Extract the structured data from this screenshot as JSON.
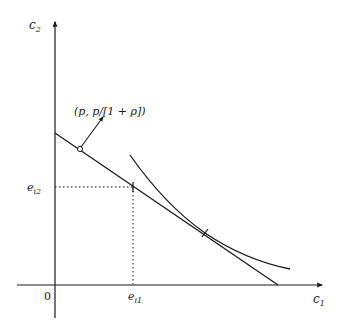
{
  "diagram": {
    "type": "intertemporal-consumption-choice",
    "axes": {
      "x": {
        "label": "c",
        "subscript": "1"
      },
      "y": {
        "label": "c",
        "subscript": "2"
      },
      "origin_label": "0"
    },
    "endowment": {
      "x_label": "e",
      "x_subscript": "i1",
      "y_label": "e",
      "y_subscript": "i2"
    },
    "budget_line_normal_label": "(p, p/[1 + ρ])",
    "elements": [
      "budget line through endowment point",
      "indifference curve tangent to budget line",
      "normal vector to budget line"
    ],
    "colors": {
      "ink": "#1a1a1a",
      "background": "#ffffff"
    }
  }
}
